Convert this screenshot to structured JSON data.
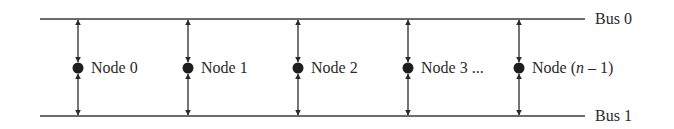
{
  "diagram": {
    "type": "dual-bus network",
    "colors": {
      "line": "#3a3a3a",
      "node": "#1e1e1e",
      "text": "#2a2a2a",
      "background": "#ffffff"
    },
    "buses": [
      {
        "id": "bus0",
        "label": "Bus 0",
        "y": 19
      },
      {
        "id": "bus1",
        "label": "Bus 1",
        "y": 116
      }
    ],
    "nodes": [
      {
        "label": "Node 0",
        "x": 78
      },
      {
        "label": "Node 1",
        "x": 188
      },
      {
        "label": "Node 2",
        "x": 298
      },
      {
        "label": "Node 3 ...",
        "x": 408
      },
      {
        "label_prefix": "Node (",
        "label_var": "n",
        "label_suffix": " – 1)",
        "x": 519
      }
    ],
    "connections": "bidirectional arrows from each node to Bus 0 and Bus 1"
  }
}
